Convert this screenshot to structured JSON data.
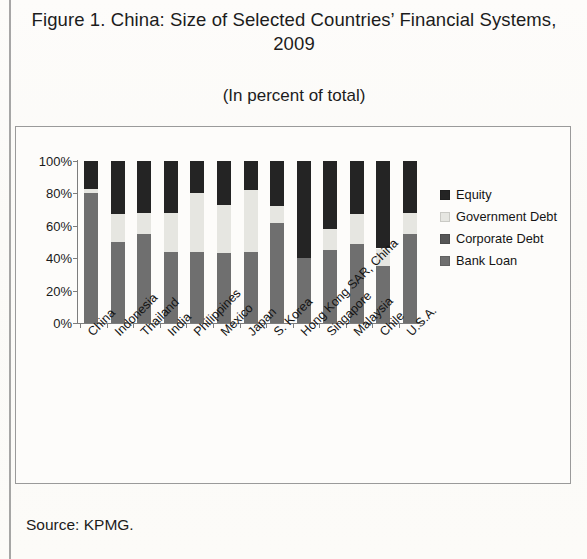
{
  "figure": {
    "title": "Figure 1. China: Size of Selected Countries’ Financial Systems, 2009",
    "subtitle": "(In percent of total)",
    "source": "Source: KPMG."
  },
  "legend": {
    "items": [
      {
        "label": "Equity",
        "color": "#242424",
        "key": "equity"
      },
      {
        "label": "Government Debt",
        "color": "#e6e6e1",
        "key": "government_debt"
      },
      {
        "label": "Corporate Debt",
        "color": "#565656",
        "key": "corporate_debt"
      },
      {
        "label": "Bank Loan",
        "color": "#6f6f6f",
        "key": "bank_loan"
      }
    ]
  },
  "chart_data": {
    "type": "bar",
    "stacked": true,
    "stack_order": [
      "Bank Loan",
      "Corporate Debt",
      "Government Debt",
      "Equity"
    ],
    "title": "Figure 1. China: Size of Selected Countries’ Financial Systems, 2009",
    "subtitle": "(In percent of total)",
    "xlabel": "",
    "ylabel": "",
    "ylim": [
      0,
      100
    ],
    "yticks": [
      "0%",
      "20%",
      "40%",
      "60%",
      "80%",
      "100%"
    ],
    "ytick_values": [
      0,
      20,
      40,
      60,
      80,
      100
    ],
    "grid": false,
    "legend_position": "right",
    "categories": [
      "China",
      "Indonesia",
      "Thailand",
      "India",
      "Philippines",
      "Mexico",
      "Japan",
      "S. Korea",
      "Hong Kong SAR, China",
      "Singapore",
      "Malaysia",
      "Chile",
      "U.S.A."
    ],
    "series": [
      {
        "name": "Bank Loan",
        "color": "#6f6f6f",
        "values": [
          80,
          50,
          55,
          44,
          44,
          43,
          44,
          62,
          40,
          45,
          49,
          35,
          55
        ]
      },
      {
        "name": "Corporate Debt",
        "color": "#565656",
        "values": [
          0,
          0,
          0,
          0,
          0,
          0,
          0,
          0,
          0,
          0,
          0,
          0,
          0
        ]
      },
      {
        "name": "Government Debt",
        "color": "#e6e6e1",
        "values": [
          3,
          17,
          13,
          24,
          36,
          30,
          38,
          10,
          0,
          13,
          18,
          11,
          13
        ]
      },
      {
        "name": "Equity",
        "color": "#242424",
        "values": [
          17,
          33,
          32,
          32,
          20,
          27,
          18,
          28,
          60,
          42,
          33,
          54,
          32
        ]
      }
    ]
  }
}
